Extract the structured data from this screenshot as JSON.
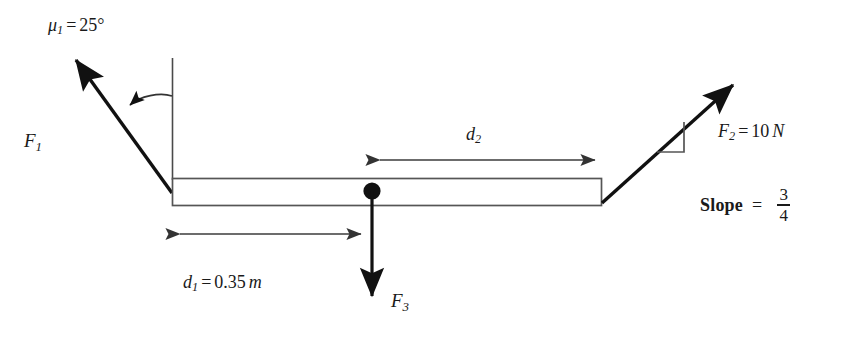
{
  "figure": {
    "background_color": "#ffffff",
    "stroke_color": "#1a1a1a",
    "dimension_line_color": "#3b3b3b"
  },
  "labels": {
    "angle": {
      "symbol": "μ",
      "subscript": "1",
      "equals": "=",
      "value": "25°",
      "full_text": "μ₁ = 25°"
    },
    "force1": {
      "symbol": "F",
      "subscript": "1",
      "full_text": "F₁"
    },
    "force2": {
      "symbol": "F",
      "subscript": "2",
      "equals": "=",
      "value": "10",
      "unit": "N",
      "full_text": "F₂ = 10 N"
    },
    "force3": {
      "symbol": "F",
      "subscript": "3",
      "full_text": "F₃"
    },
    "distance1": {
      "symbol": "d",
      "subscript": "1",
      "equals": "=",
      "value": "0.35",
      "unit": "m",
      "full_text": "d₁ = 0.35 m"
    },
    "distance2": {
      "symbol": "d",
      "subscript": "2",
      "full_text": "d₂"
    },
    "slope": {
      "word": "Slope",
      "equals": "=",
      "numerator": "3",
      "denominator": "4",
      "full_text": "Slope = 3/4"
    }
  },
  "geometry": {
    "beam": {
      "x": 172,
      "y": 178,
      "width": 430,
      "height": 28
    },
    "pivot": {
      "cx": 372,
      "cy": 191,
      "r": 8
    },
    "vertical_reference_line": {
      "x": 172,
      "y1": 58,
      "y2": 178
    },
    "force1_arrow": {
      "x1": 172,
      "y1": 192,
      "x2": 70,
      "y2": 53
    },
    "force2_arrow": {
      "x1": 602,
      "y1": 202,
      "x2": 740,
      "y2": 78
    },
    "force3_arrow": {
      "x1": 372,
      "y1": 191,
      "x2": 372,
      "y2": 305
    },
    "angle_arc": {
      "from_x": 172,
      "from_y": 96,
      "to_x": 128,
      "to_y": 106
    },
    "dim_d1": {
      "x1": 172,
      "x2": 368,
      "y": 234
    },
    "dim_d2": {
      "x1": 373,
      "x2": 602,
      "y": 160
    },
    "slope_triangle": {
      "x_left": 657,
      "x_right": 684,
      "y_top": 122,
      "y_bottom": 152
    }
  }
}
